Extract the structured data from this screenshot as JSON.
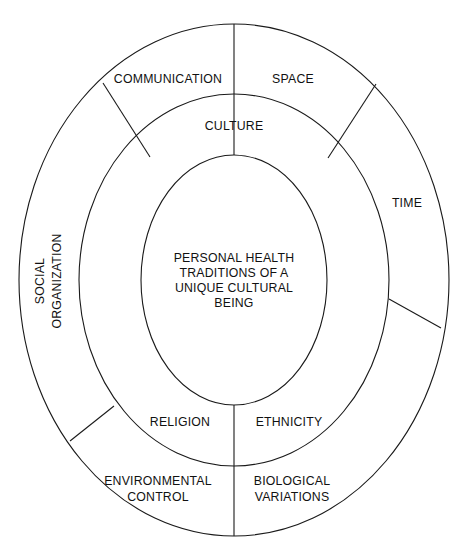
{
  "diagram": {
    "type": "concentric-ellipse-segments",
    "title_visible": false,
    "colors": {
      "background": "#ffffff",
      "stroke": "#1a1a1a",
      "text": "#111111"
    },
    "geometry": {
      "center_x": 234,
      "center_y": 280,
      "inner_rx": 93,
      "inner_ry": 125,
      "middle_rx": 155,
      "middle_ry": 186,
      "outer_rx": 215,
      "outer_ry": 256
    },
    "center": {
      "lines": [
        "PERSONAL HEALTH",
        "TRADITIONS OF A",
        "UNIQUE CULTURAL",
        "BEING"
      ]
    },
    "middle_ring": {
      "labels": [
        {
          "text": "CULTURE",
          "x": 234,
          "y": 127
        },
        {
          "text": "RELIGION",
          "x": 180,
          "y": 423
        },
        {
          "text": "ETHNICITY",
          "x": 288,
          "y": 423
        }
      ]
    },
    "outer_ring": {
      "labels": [
        {
          "text": "COMMUNICATION",
          "x": 168,
          "y": 80
        },
        {
          "text": "SPACE",
          "x": 293,
          "y": 80
        },
        {
          "text": "TIME",
          "x": 407,
          "y": 204
        },
        {
          "text": "ENVIRONMENTAL",
          "x": 158,
          "y": 482
        },
        {
          "text": "CONTROL",
          "x": 158,
          "y": 497
        },
        {
          "text": "BIOLOGICAL",
          "x": 292,
          "y": 482
        },
        {
          "text": "VARIATIONS",
          "x": 292,
          "y": 497
        }
      ],
      "rotated_labels": [
        {
          "text": "SOCIAL",
          "x": 41,
          "y": 281,
          "rotation": -90
        },
        {
          "text": "ORGANIZATION",
          "x": 58,
          "y": 281,
          "rotation": -90
        }
      ]
    },
    "dividers": {
      "vertical": [
        {
          "name": "top-vertical",
          "x1": 234,
          "y1": 24,
          "x2": 234,
          "y2": 155
        },
        {
          "name": "bottom-vertical",
          "x1": 234,
          "y1": 405,
          "x2": 234,
          "y2": 536
        }
      ],
      "radial": [
        {
          "name": "upper-left-radial",
          "x1": 103,
          "y1": 83,
          "x2": 150,
          "y2": 157
        },
        {
          "name": "upper-right-radial",
          "x1": 376,
          "y1": 84,
          "x2": 328,
          "y2": 158
        },
        {
          "name": "lower-right-radial",
          "x1": 389,
          "y1": 299,
          "x2": 441,
          "y2": 328
        },
        {
          "name": "lower-left-radial",
          "x1": 114,
          "y1": 406,
          "x2": 70,
          "y2": 441
        }
      ]
    }
  }
}
